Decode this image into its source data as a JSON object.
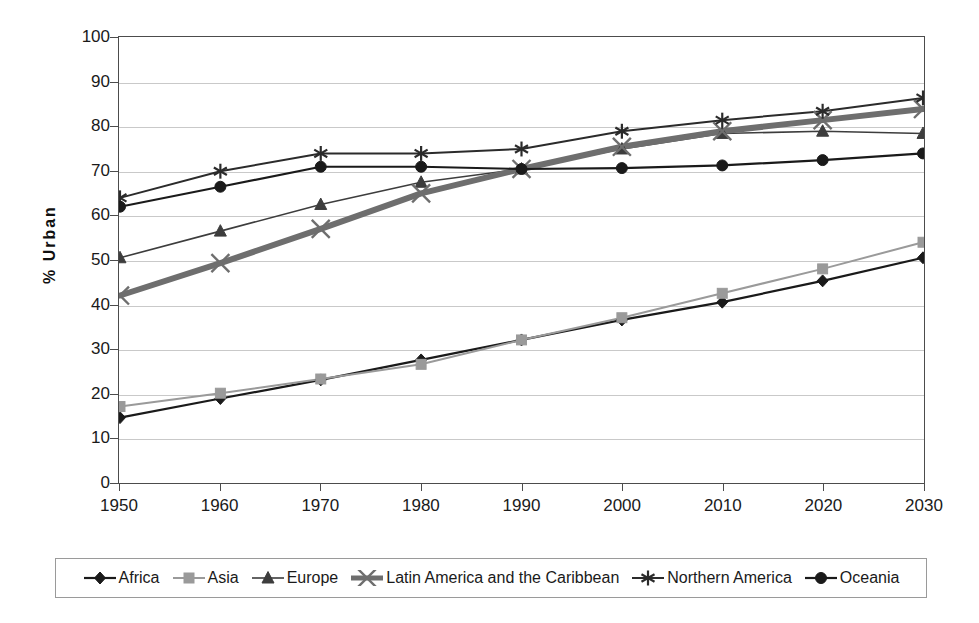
{
  "chart_data": {
    "type": "line",
    "title": "",
    "xlabel": "",
    "ylabel": "% Urban",
    "xlim": [
      1950,
      2030
    ],
    "ylim": [
      0,
      100
    ],
    "grid": true,
    "legend_position": "bottom",
    "x": [
      1950,
      1960,
      1970,
      1980,
      1990,
      2000,
      2010,
      2020,
      2030
    ],
    "categories": [
      "1950",
      "1960",
      "1970",
      "1980",
      "1990",
      "2000",
      "2010",
      "2020",
      "2030"
    ],
    "y_ticks": [
      0,
      10,
      20,
      30,
      40,
      50,
      60,
      70,
      80,
      90,
      100
    ],
    "y_tick_labels": [
      "0",
      "10",
      "20",
      "30",
      "40",
      "50",
      "60",
      "70",
      "80",
      "90",
      "100"
    ],
    "series": [
      {
        "name": "Africa",
        "marker": "diamond",
        "color": "#1a1a1a",
        "line_width": 2.2,
        "values": [
          14.5,
          18.8,
          23.0,
          27.5,
          32.0,
          36.5,
          40.5,
          45.3,
          50.5
        ]
      },
      {
        "name": "Asia",
        "marker": "square",
        "color": "#9a9a9a",
        "line_width": 2.0,
        "values": [
          17.0,
          20.0,
          23.2,
          26.5,
          32.0,
          37.0,
          42.5,
          48.0,
          54.0
        ]
      },
      {
        "name": "Europe",
        "marker": "triangle",
        "color": "#3d3d3d",
        "line_width": 1.6,
        "values": [
          50.5,
          56.5,
          62.5,
          67.5,
          70.5,
          75.0,
          78.5,
          79.0,
          78.5
        ]
      },
      {
        "name": "Latin America and the Caribbean",
        "marker": "cross-x",
        "color": "#6e6e6e",
        "line_width": 6.0,
        "values": [
          42.0,
          49.3,
          57.0,
          65.0,
          70.5,
          75.5,
          79.0,
          81.5,
          84.0
        ]
      },
      {
        "name": "Northern America",
        "marker": "asterisk",
        "color": "#2b2b2b",
        "line_width": 2.0,
        "values": [
          64.0,
          70.0,
          74.0,
          74.0,
          75.0,
          79.0,
          81.5,
          83.5,
          86.5
        ]
      },
      {
        "name": "Oceania",
        "marker": "circle",
        "color": "#1a1a1a",
        "line_width": 2.2,
        "values": [
          62.0,
          66.5,
          71.0,
          71.0,
          70.5,
          70.7,
          71.3,
          72.5,
          74.0
        ]
      }
    ]
  },
  "axis": {
    "y_title": "% Urban"
  },
  "colors": {
    "plot_border": "#4c4c4c",
    "gridline": "#c9c9c9",
    "legend_border": "#9a9a9a",
    "background": "#ffffff"
  }
}
